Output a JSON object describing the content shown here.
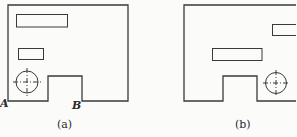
{
  "figure": {
    "panels": [
      {
        "id": "a",
        "caption": "(a)",
        "point_labels": [
          "A",
          "B"
        ]
      },
      {
        "id": "b",
        "caption": "(b)",
        "point_labels": []
      }
    ]
  },
  "colors": {
    "background": "#fbfbfa",
    "stroke": "#3a3a3a"
  }
}
